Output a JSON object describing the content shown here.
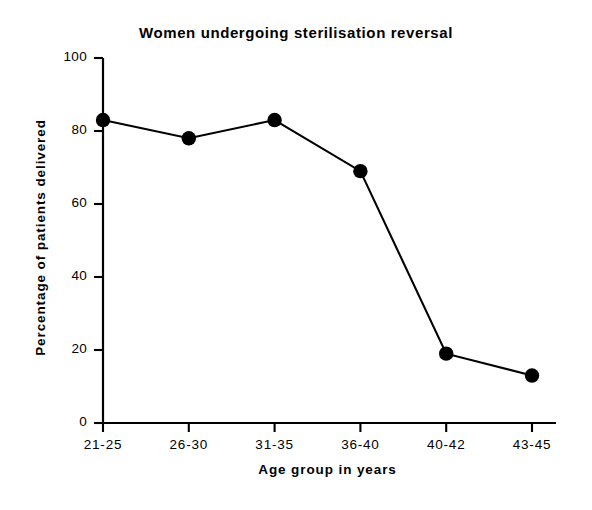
{
  "chart_data": {
    "type": "line",
    "title": "Women undergoing sterilisation reversal",
    "xlabel": "Age group in years",
    "ylabel": "Percentage of patients delivered",
    "categories": [
      "21-25",
      "26-30",
      "31-35",
      "36-40",
      "40-42",
      "43-45"
    ],
    "values": [
      83,
      78,
      83,
      69,
      19,
      13
    ],
    "ylim": [
      0,
      100
    ],
    "yticks": [
      0,
      20,
      40,
      60,
      80,
      100
    ],
    "ytick_labels": [
      "0",
      "20",
      "40",
      "60",
      "80",
      "100"
    ],
    "grid": false,
    "legend": false,
    "marker": "filled-circle",
    "line_color": "#000000",
    "marker_color": "#000000",
    "background_color": "#ffffff",
    "series": [
      {
        "name": "Percentage of patients delivered",
        "values": [
          83,
          78,
          83,
          69,
          19,
          13
        ]
      }
    ]
  }
}
